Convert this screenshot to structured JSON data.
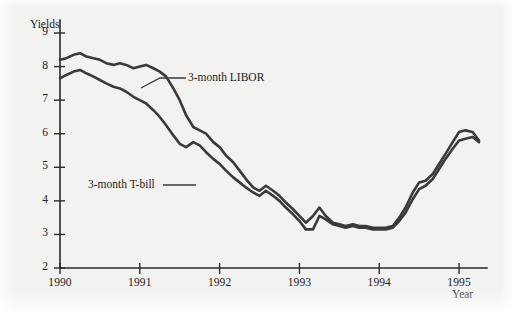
{
  "figure": {
    "background_color": "#f2f2f0",
    "line_color": "#3a3a3a",
    "axis_color": "#2b2b2b"
  },
  "chart_data": {
    "type": "line",
    "title": "",
    "xlabel": "Year",
    "ylabel": "Yields",
    "xlim": [
      1990,
      1995.35
    ],
    "ylim": [
      2,
      9
    ],
    "grid": false,
    "legend_position": "inline-annotations",
    "xticks": [
      1990,
      1991,
      1992,
      1993,
      1994,
      1995
    ],
    "xtick_labels": [
      "1990",
      "1991",
      "1992",
      "1993",
      "1994",
      "1995"
    ],
    "yticks": [
      2,
      3,
      4,
      5,
      6,
      7,
      8,
      9
    ],
    "ytick_labels": [
      "2",
      "3",
      "4",
      "5",
      "6",
      "7",
      "8",
      "9"
    ],
    "annotations": [
      {
        "text": "3-month LIBOR",
        "points_to_series": "3-month LIBOR"
      },
      {
        "text": "3-month T-bill",
        "points_to_series": "3-month T-bill"
      }
    ],
    "series": [
      {
        "name": "3-month LIBOR",
        "x": [
          1990.0,
          1990.08,
          1990.17,
          1990.25,
          1990.33,
          1990.42,
          1990.5,
          1990.58,
          1990.67,
          1990.75,
          1990.83,
          1990.92,
          1991.0,
          1991.08,
          1991.17,
          1991.25,
          1991.33,
          1991.42,
          1991.5,
          1991.58,
          1991.67,
          1991.75,
          1991.83,
          1991.92,
          1992.0,
          1992.08,
          1992.17,
          1992.25,
          1992.33,
          1992.42,
          1992.5,
          1992.58,
          1992.67,
          1992.75,
          1992.83,
          1992.92,
          1993.0,
          1993.08,
          1993.17,
          1993.25,
          1993.33,
          1993.42,
          1993.5,
          1993.58,
          1993.67,
          1993.75,
          1993.83,
          1993.92,
          1994.0,
          1994.08,
          1994.17,
          1994.25,
          1994.33,
          1994.42,
          1994.5,
          1994.58,
          1994.67,
          1994.75,
          1994.83,
          1994.92,
          1995.0,
          1995.08,
          1995.17,
          1995.25
        ],
        "values": [
          8.2,
          8.25,
          8.35,
          8.4,
          8.3,
          8.25,
          8.2,
          8.1,
          8.05,
          8.1,
          8.05,
          7.95,
          8.0,
          8.05,
          7.95,
          7.85,
          7.7,
          7.35,
          7.0,
          6.55,
          6.2,
          6.1,
          6.0,
          5.75,
          5.6,
          5.35,
          5.15,
          4.9,
          4.65,
          4.4,
          4.3,
          4.45,
          4.3,
          4.15,
          3.95,
          3.75,
          3.55,
          3.35,
          3.55,
          3.8,
          3.55,
          3.35,
          3.3,
          3.25,
          3.3,
          3.25,
          3.25,
          3.2,
          3.2,
          3.2,
          3.25,
          3.5,
          3.8,
          4.25,
          4.55,
          4.6,
          4.8,
          5.1,
          5.4,
          5.75,
          6.05,
          6.1,
          6.05,
          5.8
        ],
        "color": "#3a3a3a"
      },
      {
        "name": "3-month T-bill",
        "x": [
          1990.0,
          1990.08,
          1990.17,
          1990.25,
          1990.33,
          1990.42,
          1990.5,
          1990.58,
          1990.67,
          1990.75,
          1990.83,
          1990.92,
          1991.0,
          1991.08,
          1991.17,
          1991.25,
          1991.33,
          1991.42,
          1991.5,
          1991.58,
          1991.67,
          1991.75,
          1991.83,
          1991.92,
          1992.0,
          1992.08,
          1992.17,
          1992.25,
          1992.33,
          1992.42,
          1992.5,
          1992.58,
          1992.67,
          1992.75,
          1992.83,
          1992.92,
          1993.0,
          1993.08,
          1993.17,
          1993.25,
          1993.33,
          1993.42,
          1993.5,
          1993.58,
          1993.67,
          1993.75,
          1993.83,
          1993.92,
          1994.0,
          1994.08,
          1994.17,
          1994.25,
          1994.33,
          1994.42,
          1994.5,
          1994.58,
          1994.67,
          1994.75,
          1994.83,
          1994.92,
          1995.0,
          1995.08,
          1995.17,
          1995.25
        ],
        "values": [
          7.65,
          7.75,
          7.85,
          7.9,
          7.8,
          7.7,
          7.6,
          7.5,
          7.4,
          7.35,
          7.25,
          7.1,
          7.0,
          6.9,
          6.7,
          6.5,
          6.25,
          5.95,
          5.7,
          5.6,
          5.75,
          5.65,
          5.45,
          5.25,
          5.1,
          4.9,
          4.7,
          4.55,
          4.4,
          4.25,
          4.15,
          4.3,
          4.15,
          4.0,
          3.8,
          3.6,
          3.4,
          3.15,
          3.15,
          3.55,
          3.45,
          3.3,
          3.25,
          3.2,
          3.25,
          3.2,
          3.2,
          3.15,
          3.15,
          3.15,
          3.2,
          3.4,
          3.65,
          4.05,
          4.35,
          4.45,
          4.65,
          4.95,
          5.25,
          5.55,
          5.8,
          5.85,
          5.9,
          5.75
        ],
        "color": "#3a3a3a"
      }
    ]
  }
}
